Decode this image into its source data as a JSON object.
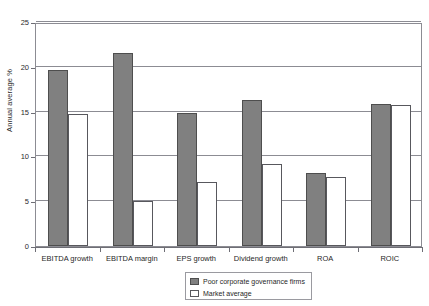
{
  "chart_data": {
    "type": "bar",
    "title": "",
    "subtitle": "",
    "xlabel": "",
    "ylabel": "Annual average %",
    "ylim": [
      0,
      25
    ],
    "yticks": [
      0,
      5,
      10,
      15,
      20,
      25
    ],
    "ytick_labels": [
      "0",
      "5",
      "10",
      "15",
      "20",
      "25"
    ],
    "grid": true,
    "grid_axis": "y",
    "legend_position": "bottom-center",
    "categories": [
      "EBITDA growth",
      "EBITDA margin",
      "EPS growth",
      "Dividend growth",
      "ROA",
      "ROIC"
    ],
    "series": [
      {
        "name": "Poor corporate governance firms",
        "color": "#808080",
        "values": [
          19.6,
          21.5,
          14.8,
          16.3,
          8.1,
          15.9
        ]
      },
      {
        "name": "Market average",
        "color": "#ffffff",
        "values": [
          14.7,
          5.0,
          7.1,
          9.2,
          7.7,
          15.7
        ]
      }
    ]
  },
  "legend": {
    "items": [
      {
        "label": "Poor corporate governance firms",
        "swatch": "gray"
      },
      {
        "label": "Market average",
        "swatch": "white"
      }
    ]
  },
  "colors": {
    "series_gray": "#808080",
    "series_white": "#ffffff",
    "axis": "#6e6e75",
    "grid": "#8c8c93",
    "text": "#1f1f1f"
  }
}
